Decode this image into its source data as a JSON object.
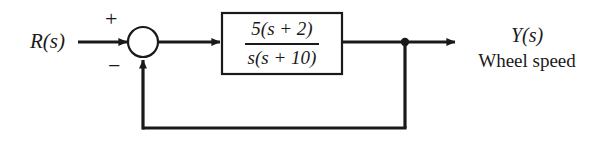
{
  "diagram": {
    "type": "control-system-block-diagram",
    "background_color": "#ffffff",
    "line_color": "#1a1a1a",
    "input": {
      "label": "R(s)"
    },
    "summing_junction": {
      "shape": "circle",
      "reference_sign": "+",
      "feedback_sign": "−"
    },
    "plant_block": {
      "transfer_function": "5(s + 2) / s(s + 10)",
      "numerator": "5(s + 2)",
      "denominator": "s(s + 10)"
    },
    "takeoff_node": {
      "label": "takeoff-dot"
    },
    "feedback_path": {
      "gain": "1",
      "type": "unity"
    },
    "output": {
      "symbol": "Y(s)",
      "description": "Wheel speed"
    }
  }
}
